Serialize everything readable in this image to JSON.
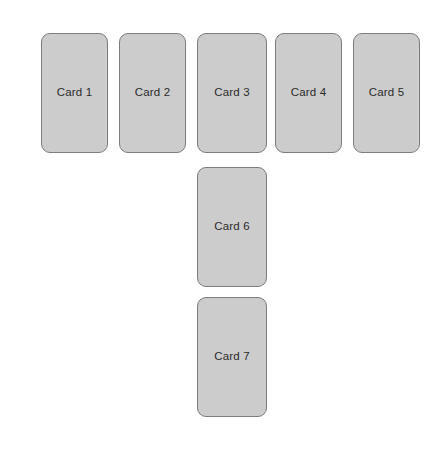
{
  "canvas": {
    "width": 445,
    "height": 451,
    "background_color": "#ffffff"
  },
  "style": {
    "card_fill_color": "#cccccc",
    "card_border_color": "#7d7d7d",
    "card_text_color": "#2b2b2b",
    "card_corner_radius": "9px"
  },
  "layout": {
    "description": "T-shaped arrangement: a top row of five cards, with two additional cards stacked below the third column",
    "top_row_count": 5,
    "column_count": 2
  },
  "cards": [
    {
      "label": "Card 1",
      "x": 41,
      "y": 33,
      "width": 67,
      "height": 120
    },
    {
      "label": "Card 2",
      "x": 119,
      "y": 33,
      "width": 67,
      "height": 120
    },
    {
      "label": "Card 3",
      "x": 197,
      "y": 33,
      "width": 70,
      "height": 120
    },
    {
      "label": "Card 4",
      "x": 275,
      "y": 33,
      "width": 67,
      "height": 120
    },
    {
      "label": "Card 5",
      "x": 353,
      "y": 33,
      "width": 67,
      "height": 120
    },
    {
      "label": "Card 6",
      "x": 197,
      "y": 167,
      "width": 70,
      "height": 120
    },
    {
      "label": "Card 7",
      "x": 197,
      "y": 297,
      "width": 70,
      "height": 120
    }
  ]
}
